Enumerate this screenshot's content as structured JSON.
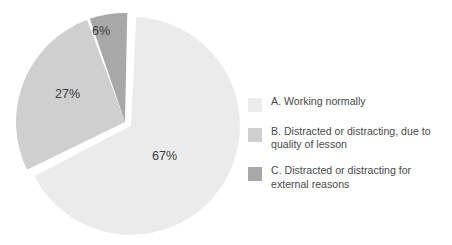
{
  "chart_data": {
    "type": "pie",
    "title": "",
    "subtitle": "",
    "xlabel": "",
    "ylabel": "",
    "grid": false,
    "legend_position": "right",
    "value_suffix": "%",
    "categories": [
      "A. Working normally",
      "B. Distracted or distracting, due to quality of lesson",
      "C. Distracted or distracting for external reasons"
    ],
    "values": [
      67,
      27,
      6
    ],
    "labels": [
      "67%",
      "27%",
      "6%"
    ],
    "colors": [
      "#ebebeb",
      "#cfcfcf",
      "#a8a8a8"
    ],
    "slices": [
      {
        "key": "A",
        "label": "67%",
        "value": 67,
        "color": "#ebebeb",
        "exploded": true
      },
      {
        "key": "B",
        "label": "27%",
        "value": 27,
        "color": "#cfcfcf",
        "exploded": false
      },
      {
        "key": "C",
        "label": "6%",
        "value": 6,
        "color": "#a8a8a8",
        "exploded": false
      }
    ]
  },
  "legend": {
    "items": [
      {
        "swatch_name": "legend-swatch-a",
        "color": "#ebebeb",
        "text": "A. Working normally"
      },
      {
        "swatch_name": "legend-swatch-b",
        "color": "#cfcfcf",
        "text": "B. Distracted or distracting, due to quality of lesson"
      },
      {
        "swatch_name": "legend-swatch-c",
        "color": "#a8a8a8",
        "text": "C. Distracted or distracting for external reasons"
      }
    ]
  }
}
